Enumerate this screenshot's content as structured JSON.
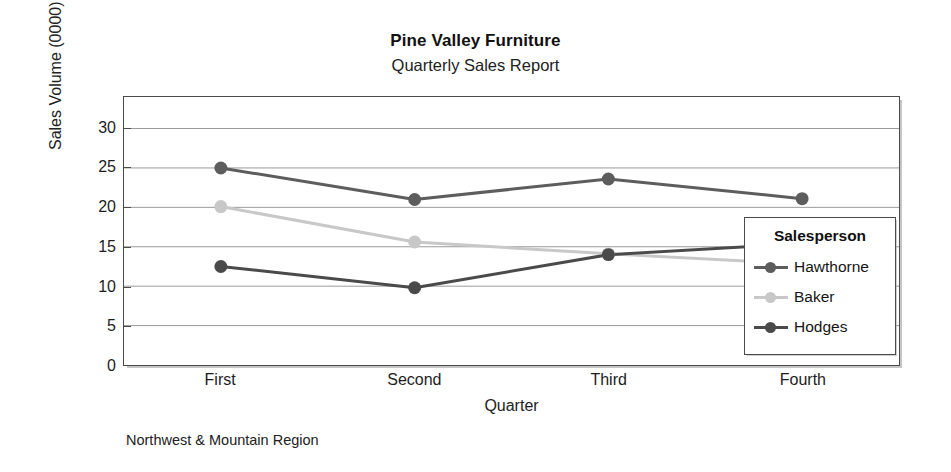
{
  "chart_data": {
    "type": "line",
    "title": "Pine Valley Furniture",
    "subtitle": "Quarterly Sales Report",
    "footnote": "Northwest & Mountain Region",
    "xlabel": "Quarter",
    "ylabel": "Sales Volume (0000)",
    "categories": [
      "First",
      "Second",
      "Third",
      "Fourth"
    ],
    "ylim": [
      0,
      34
    ],
    "yticks": [
      0,
      5,
      10,
      15,
      20,
      25,
      30
    ],
    "ytick_labels": [
      "0",
      "5",
      "10",
      "15",
      "20",
      "25",
      "30"
    ],
    "grid": true,
    "grid_axis": "y",
    "legend_position": "inside-right",
    "legend_title": "Salesperson",
    "series": [
      {
        "name": "Hawthorne",
        "values": [
          25.0,
          21.0,
          23.6,
          21.1
        ],
        "color": "#5d5d5d"
      },
      {
        "name": "Baker",
        "values": [
          20.1,
          15.6,
          14.1,
          12.8
        ],
        "color": "#c8c8c8"
      },
      {
        "name": "Hodges",
        "values": [
          12.5,
          9.8,
          14.0,
          15.4
        ],
        "color": "#4a4a4a"
      }
    ]
  },
  "axis": {
    "y_title": "Sales Volume (0000)",
    "x_title": "Quarter"
  },
  "legend": {
    "title": "Salesperson",
    "items": [
      {
        "label": "Hawthorne"
      },
      {
        "label": "Baker"
      },
      {
        "label": "Hodges"
      }
    ]
  },
  "colors": {
    "hawthorne": "#5d5d5d",
    "baker": "#c8c8c8",
    "hodges": "#4a4a4a",
    "frame": "#4a4a4a",
    "gridline": "#9a9a9a",
    "background": "#ffffff"
  }
}
